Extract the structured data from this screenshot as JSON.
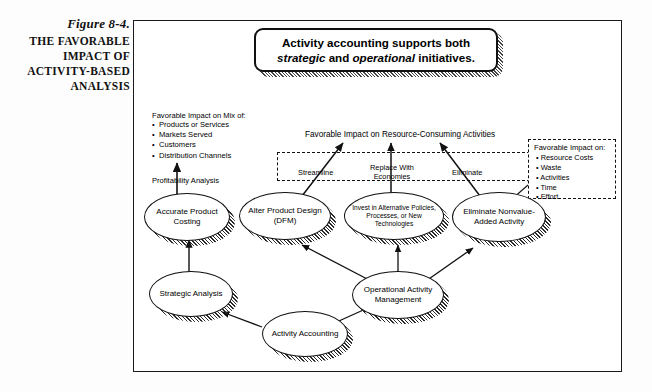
{
  "figure": {
    "number": "Figure 8-4.",
    "title_lines": [
      "THE FAVORABLE",
      "IMPACT OF",
      "ACTIVITY-BASED",
      "ANALYSIS"
    ]
  },
  "callout": {
    "line1": "Activity accounting supports both",
    "line2_pre": "",
    "em1": "strategic",
    "mid": " and ",
    "em2": "operational",
    "line2_post": " initiatives.",
    "full_text": "Activity accounting supports both strategic and operational initiatives."
  },
  "left_annotation": {
    "heading": "Favorable Impact on Mix of:",
    "items": [
      "Products or Services",
      "Markets Served",
      "Customers",
      "Distribution Channels"
    ],
    "arrow_label": "Profitability Analysis"
  },
  "right_annotation": {
    "heading": "Favorable Impact on:",
    "items": [
      "Resource Costs",
      "Waste",
      "Activities",
      "Time",
      "Effort"
    ]
  },
  "center_label": "Favorable Impact on Resource-Consuming Activities",
  "arrow_labels": {
    "streamline": "Streamline",
    "replace_line1": "Replace With",
    "replace_line2": "Economies",
    "eliminate": "Eliminate"
  },
  "nodes": {
    "accurate_product_costing": "Accurate Product Costing",
    "alter_product_design": "Alter Product Design (DFM)",
    "invest_alternative": "Invest in Alternative Policies, Processes, or New Technologies",
    "eliminate_nonvalue": "Eliminate Nonvalue-Added Activity",
    "strategic_analysis": "Strategic Analysis",
    "operational_activity_management": "Operational Activity Management",
    "activity_accounting": "Activity Accounting"
  },
  "colors": {
    "ink": "#111111",
    "paper": "#ffffff",
    "page": "#fdfdfd"
  }
}
